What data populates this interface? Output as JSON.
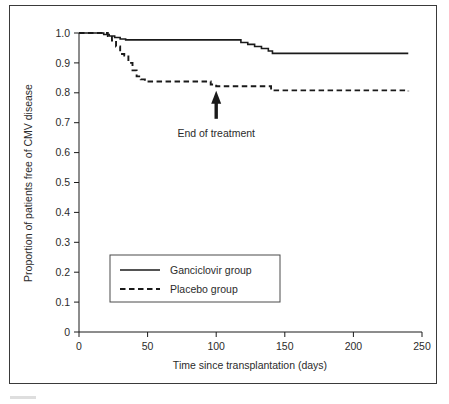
{
  "figure": {
    "background_color": "#ffffff",
    "frame_color": "#3a3a3a",
    "ink_color": "#1a1a1a"
  },
  "chart_data": {
    "type": "line",
    "title": "",
    "subtitle": "",
    "xlabel": "Time since transplantation (days)",
    "ylabel": "Proportion of patients free of CMV disease",
    "xlim": [
      0,
      250
    ],
    "ylim": [
      0,
      1.0
    ],
    "xticks": [
      0,
      50,
      100,
      150,
      200,
      250
    ],
    "xtick_labels": [
      "0",
      "50",
      "100",
      "150",
      "200",
      "250"
    ],
    "yticks": [
      0,
      0.1,
      0.2,
      0.3,
      0.4,
      0.5,
      0.6,
      0.7,
      0.8,
      0.9,
      1.0
    ],
    "ytick_labels": [
      "0",
      "0.1",
      "0.2",
      "0.3",
      "0.4",
      "0.5",
      "0.6",
      "0.7",
      "0.8",
      "0.9",
      "1.0"
    ],
    "grid": false,
    "legend_position": "lower-left-inset",
    "step_style": "post",
    "series": [
      {
        "name": "Ganciclovir group",
        "style": "solid",
        "color": "#1a1a1a",
        "x": [
          0,
          14,
          18,
          22,
          26,
          30,
          34,
          113,
          118,
          123,
          128,
          133,
          138,
          141,
          240
        ],
        "y": [
          1.0,
          1.0,
          0.995,
          0.99,
          0.985,
          0.98,
          0.977,
          0.977,
          0.968,
          0.962,
          0.955,
          0.948,
          0.94,
          0.932,
          0.932
        ]
      },
      {
        "name": "Placebo group",
        "style": "dashed",
        "color": "#1a1a1a",
        "x": [
          0,
          17,
          21,
          24,
          27,
          30,
          33,
          36,
          39,
          42,
          45,
          48,
          92,
          96,
          100,
          136,
          140,
          240
        ],
        "y": [
          1.0,
          1.0,
          0.99,
          0.975,
          0.955,
          0.93,
          0.925,
          0.9,
          0.875,
          0.855,
          0.845,
          0.838,
          0.838,
          0.828,
          0.822,
          0.822,
          0.808,
          0.805
        ]
      }
    ],
    "annotations": [
      {
        "text": "End of treatment",
        "x": 100,
        "y": 0.8,
        "marker": "up-arrow"
      }
    ]
  },
  "legend": {
    "items": [
      {
        "label": "Ganciclovir group",
        "style": "solid"
      },
      {
        "label": "Placebo group",
        "style": "dashed"
      }
    ]
  }
}
